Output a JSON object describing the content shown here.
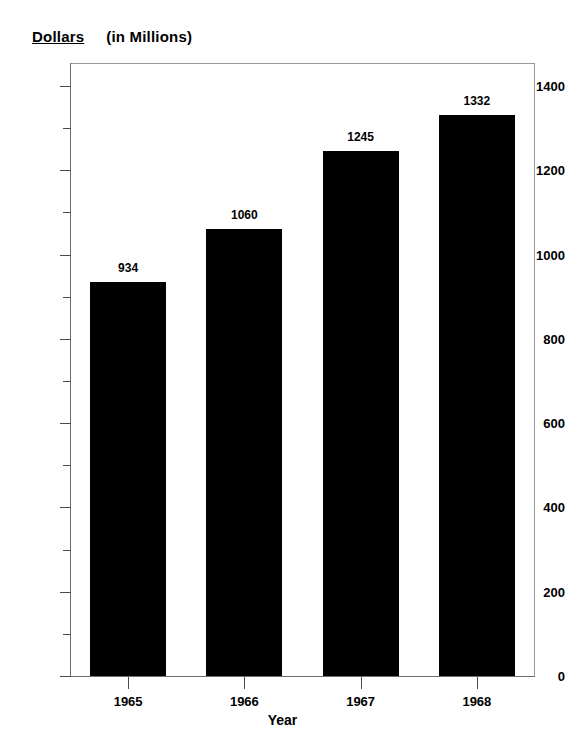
{
  "title": {
    "main": "Dollars",
    "sub": "(in Millions)"
  },
  "chart_data": {
    "type": "bar",
    "title": "Dollars (in Millions)",
    "xlabel": "Year",
    "ylabel": "Dollars (in Millions)",
    "categories": [
      "1965",
      "1966",
      "1967",
      "1968"
    ],
    "values": [
      934,
      1060,
      1245,
      1332
    ],
    "value_labels": [
      "934",
      "1060",
      "1245",
      "1332"
    ],
    "ylim": [
      0,
      1400
    ],
    "y_ticks": [
      0,
      200,
      400,
      600,
      800,
      1000,
      1200,
      1400
    ],
    "y_tick_labels": [
      "0",
      "200",
      "400",
      "600",
      "800",
      "1000",
      "1200",
      "1400"
    ],
    "y_minor_ticks": [
      100,
      300,
      500,
      700,
      900,
      1100,
      1300
    ],
    "grid": false,
    "legend": null,
    "bar_color": "#000000",
    "background_color": "#ffffff",
    "frame_color": "#9a9a9a"
  }
}
